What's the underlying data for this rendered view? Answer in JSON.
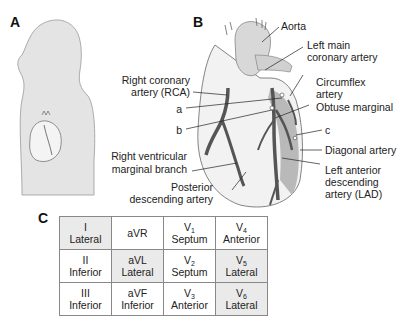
{
  "panels": {
    "a": {
      "letter": "A"
    },
    "b": {
      "letter": "B"
    },
    "c": {
      "letter": "C"
    }
  },
  "heart_labels": {
    "aorta": "Aorta",
    "left_main_1": "Left main",
    "left_main_2": "coronary artery",
    "circumflex_1": "Circumflex",
    "circumflex_2": "artery",
    "obtuse_marginal": "Obtuse marginal",
    "c": "c",
    "diagonal": "Diagonal artery",
    "lad_1": "Left anterior",
    "lad_2": "descending",
    "lad_3": "artery (LAD)",
    "rca_1": "Right coronary",
    "rca_2": "artery (RCA)",
    "a": "a",
    "b": "b",
    "rv_marginal_1": "Right ventricular",
    "rv_marginal_2": "marginal branch",
    "pda_1": "Posterior",
    "pda_2": "descending artery"
  },
  "ecg_table": {
    "rows": [
      [
        {
          "lead": "I",
          "sub": "",
          "region": "Lateral",
          "shaded": true
        },
        {
          "lead": "aVR",
          "sub": "",
          "region": "",
          "shaded": false
        },
        {
          "lead": "V",
          "sub": "1",
          "region": "Septum",
          "shaded": false
        },
        {
          "lead": "V",
          "sub": "4",
          "region": "Anterior",
          "shaded": false
        }
      ],
      [
        {
          "lead": "II",
          "sub": "",
          "region": "Inferior",
          "shaded": false
        },
        {
          "lead": "aVL",
          "sub": "",
          "region": "Lateral",
          "shaded": true
        },
        {
          "lead": "V",
          "sub": "2",
          "region": "Septum",
          "shaded": false
        },
        {
          "lead": "V",
          "sub": "5",
          "region": "Lateral",
          "shaded": true
        }
      ],
      [
        {
          "lead": "III",
          "sub": "",
          "region": "Inferior",
          "shaded": false
        },
        {
          "lead": "aVF",
          "sub": "",
          "region": "Inferior",
          "shaded": false
        },
        {
          "lead": "V",
          "sub": "3",
          "region": "Anterior",
          "shaded": false
        },
        {
          "lead": "V",
          "sub": "6",
          "region": "Lateral",
          "shaded": true
        }
      ]
    ]
  }
}
